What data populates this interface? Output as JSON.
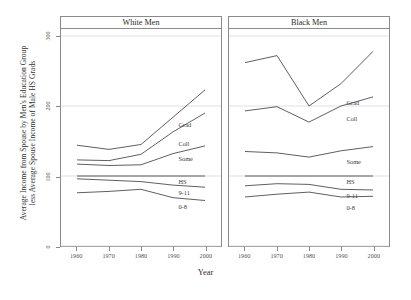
{
  "chart_data": {
    "type": "line",
    "title": "",
    "subtitle": "",
    "xlabel": "Year",
    "ylabel": "Average Income from Spouse by Men's Education Group less Average Spouse Income of Male HS Grads",
    "ylabel_line1": "Average Income from Spouse by Men's Education Group",
    "ylabel_line2": "less Average Spouse Income of Male HS Grads",
    "x": [
      1960,
      1970,
      1980,
      1990,
      2000
    ],
    "xtick_labels": [
      "1960",
      "1970",
      "1980",
      "1990",
      "2000"
    ],
    "ytick_labels": [
      "0",
      "100",
      "200",
      "300"
    ],
    "yticks": [
      0,
      100,
      200,
      300
    ],
    "ylim": [
      0,
      310
    ],
    "xlim": [
      1955,
      2005
    ],
    "grid": true,
    "grid_axis": "y",
    "legend": "inline-labels",
    "legend_position": "inline, right of each series",
    "facets": [
      {
        "name": "white-men",
        "label": "White Men",
        "series": [
          {
            "name": "Grad",
            "label": "Grad",
            "values": [
              144,
              138,
              145,
              184,
              223
            ],
            "label_x": 1990,
            "label_y": 173
          },
          {
            "name": "Coll",
            "label": "Coll",
            "values": [
              123,
              122,
              131,
              163,
              190
            ],
            "label_x": 1990,
            "label_y": 147
          },
          {
            "name": "Some",
            "label": "Some",
            "values": [
              117,
              115,
              116,
              132,
              143
            ],
            "label_x": 1990,
            "label_y": 125
          },
          {
            "name": "HS",
            "label": "HS",
            "values": [
              100,
              100,
              100,
              100,
              100
            ],
            "label_x": 1990,
            "label_y": 92
          },
          {
            "name": "9-11",
            "label": "9-11",
            "values": [
              96,
              94,
              92,
              87,
              84
            ],
            "label_x": 1990,
            "label_y": 77
          },
          {
            "name": "0-8",
            "label": "0-8",
            "values": [
              76,
              78,
              81,
              69,
              65
            ],
            "label_x": 1990,
            "label_y": 57
          }
        ]
      },
      {
        "name": "black-men",
        "label": "Black Men",
        "series": [
          {
            "name": "Grad",
            "label": "Grad",
            "values": [
              262,
              272,
              200,
              232,
              278
            ],
            "label_x": 1990,
            "label_y": 205
          },
          {
            "name": "Coll",
            "label": "Coll",
            "values": [
              193,
              199,
              177,
              200,
              213
            ],
            "label_x": 1990,
            "label_y": 182
          },
          {
            "name": "Some",
            "label": "Some",
            "values": [
              135,
              133,
              127,
              136,
              142
            ],
            "label_x": 1990,
            "label_y": 121
          },
          {
            "name": "HS",
            "label": "HS",
            "values": [
              100,
              100,
              100,
              100,
              100
            ],
            "label_x": 1990,
            "label_y": 92
          },
          {
            "name": "9-11",
            "label": "9-11",
            "values": [
              86,
              89,
              88,
              81,
              80
            ],
            "label_x": 1990,
            "label_y": 73
          },
          {
            "name": "0-8",
            "label": "0-8",
            "values": [
              70,
              74,
              77,
              70,
              71
            ],
            "label_x": 1990,
            "label_y": 55
          }
        ]
      }
    ],
    "colors": {
      "line": "#4d4d4d",
      "grid": "#d8d8d8",
      "axis": "#8a8a8a",
      "text": "#2e2e2e",
      "background": "#ffffff"
    }
  }
}
